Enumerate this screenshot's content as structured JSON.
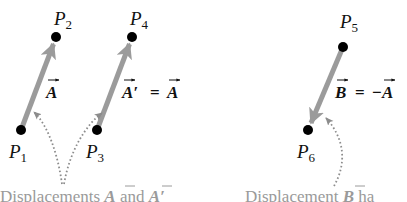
{
  "colors": {
    "background": "#ffffff",
    "vector": "#9b9b9b",
    "point": "#000000",
    "label": "#111111",
    "caption": "#9a9a9a",
    "dotted_pointer": "#8c8c8c"
  },
  "points": [
    {
      "id": "P1",
      "letter": "P",
      "sub": "1"
    },
    {
      "id": "P2",
      "letter": "P",
      "sub": "2"
    },
    {
      "id": "P3",
      "letter": "P",
      "sub": "3"
    },
    {
      "id": "P4",
      "letter": "P",
      "sub": "4"
    },
    {
      "id": "P5",
      "letter": "P",
      "sub": "5"
    },
    {
      "id": "P6",
      "letter": "P",
      "sub": "6"
    }
  ],
  "vectors": [
    {
      "id": "A",
      "from": "P1",
      "to": "P2",
      "label": "A"
    },
    {
      "id": "A_prime",
      "from": "P3",
      "to": "P4",
      "label_left": "A′",
      "equals": "=",
      "label_right": "A"
    },
    {
      "id": "B",
      "from": "P5",
      "to": "P6",
      "label_left": "B",
      "equals": "=",
      "neg": "−",
      "label_right": "A"
    }
  ],
  "captions": {
    "left": {
      "text_start": "Displacements ",
      "vec1": "A",
      "mid": " and ",
      "vec2": "A′"
    },
    "right": {
      "text_start": "Displacement ",
      "vec1": "B",
      "rest": " ha"
    }
  }
}
